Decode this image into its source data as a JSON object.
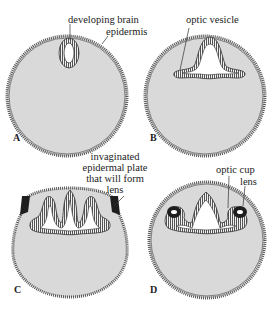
{
  "figure": {
    "panels": [
      {
        "letter": "A",
        "labels": [
          "developing brain",
          "epidermis"
        ]
      },
      {
        "letter": "B",
        "labels": [
          "optic vesicle"
        ]
      },
      {
        "letter": "C",
        "labels": [
          "invaginated",
          "epidermal plate",
          "that will form",
          "lens"
        ]
      },
      {
        "letter": "D",
        "labels": [
          "optic cup",
          "lens"
        ]
      }
    ]
  },
  "colors": {
    "fill": "#d9d9d9",
    "outline": "#3a3a3a",
    "lens_dark": "#1e1e1e",
    "background": "#ffffff"
  }
}
